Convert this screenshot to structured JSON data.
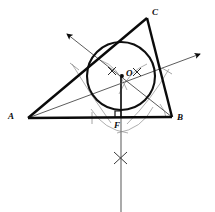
{
  "figure": {
    "type": "geometry-construction",
    "background_color": "#ffffff",
    "ink_color": "#0a0a0a",
    "construction_color": "#8a8a8a"
  },
  "labels": {
    "vertex_a": "A",
    "vertex_b": "B",
    "vertex_c": "C",
    "incenter": "O",
    "foot": "F"
  },
  "geometry": {
    "points": {
      "A": {
        "x": 28,
        "y": 118
      },
      "B": {
        "x": 172,
        "y": 117
      },
      "C": {
        "x": 147,
        "y": 18
      },
      "O": {
        "x": 122,
        "y": 76
      },
      "F": {
        "x": 121,
        "y": 117
      }
    },
    "incircle": {
      "cx": 121,
      "cy": 76,
      "r": 34
    },
    "triangle_sides": [
      {
        "name": "AB",
        "from": "A",
        "to": "B"
      },
      {
        "name": "BC",
        "from": "B",
        "to": "C"
      },
      {
        "name": "CA",
        "from": "C",
        "to": "A"
      }
    ],
    "bisector_rays": [
      {
        "name": "bisector-from-B",
        "from": {
          "x": 172,
          "y": 117
        },
        "to": {
          "x": 66,
          "y": 33
        },
        "arrow": true
      },
      {
        "name": "bisector-from-A",
        "from": {
          "x": 28,
          "y": 118
        },
        "to": {
          "x": 201,
          "y": 53
        },
        "arrow": true
      }
    ],
    "perpendicular": {
      "name": "perpendicular-through-F",
      "from": {
        "x": 121,
        "y": 74
      },
      "to": {
        "x": 121,
        "y": 212
      }
    },
    "right_angle_marker": {
      "x": 121,
      "y": 117,
      "size": 6
    },
    "tick_crosses": [
      {
        "name": "cross-left-of-O",
        "x": 112,
        "y": 71
      },
      {
        "name": "cross-right-of-O",
        "x": 137,
        "y": 72
      },
      {
        "name": "cross-below-F",
        "x": 121,
        "y": 158
      }
    ],
    "construction_arcs": [
      {
        "name": "arc-from-A-upper",
        "d": "M 72 64 Q 92 96 110 122"
      },
      {
        "name": "arc-from-A-lower",
        "d": "M 92 110 Q 108 130 130 132"
      },
      {
        "name": "arc-from-B-upper",
        "d": "M 168 70 Q 150 98 127 124"
      },
      {
        "name": "arc-from-B-lower",
        "d": "M 152 108 Q 140 128 118 132"
      },
      {
        "name": "arc-through-O-left",
        "d": "M 100 62 Q 116 68 126 88"
      },
      {
        "name": "arc-through-O-right",
        "d": "M 146 66 Q 130 72 120 92"
      }
    ]
  }
}
